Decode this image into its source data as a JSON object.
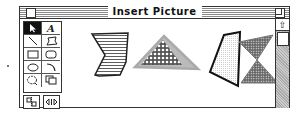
{
  "window": {
    "title": "Insert Picture",
    "close_box": "close-box",
    "zoom_box": "zoom-box"
  },
  "palette": {
    "tools": [
      {
        "name": "arrow-tool",
        "glyph": "↖",
        "selected": true
      },
      {
        "name": "text-tool",
        "glyph": "A",
        "selected": false
      },
      {
        "name": "line-tool",
        "glyph": "╲",
        "selected": false
      },
      {
        "name": "freeform-tool",
        "glyph": "▱",
        "selected": false
      },
      {
        "name": "rectangle-tool",
        "glyph": "▭",
        "selected": false
      },
      {
        "name": "rounded-rectangle-tool",
        "glyph": "▢",
        "selected": false
      },
      {
        "name": "oval-tool",
        "glyph": "⬭",
        "selected": false
      },
      {
        "name": "arc-tool",
        "glyph": "⌒",
        "selected": false
      },
      {
        "name": "lasso-tool",
        "glyph": "◌",
        "selected": false
      },
      {
        "name": "duplicate-tool",
        "glyph": "⧉",
        "selected": false
      }
    ],
    "bottom_buttons": [
      {
        "name": "flip-button",
        "glyph": "⇅"
      },
      {
        "name": "rotate-button",
        "glyph": "⇔"
      }
    ]
  },
  "canvas": {
    "shapes": [
      {
        "name": "striped-chevron-shape",
        "fill": "horizontal-lines"
      },
      {
        "name": "dotted-triangle-shape",
        "fill": "circles-on-gray"
      },
      {
        "name": "outlined-quadrilateral-shape",
        "fill": "fine-dots"
      },
      {
        "name": "hourglass-shape",
        "fill": "dots-on-gray"
      }
    ]
  },
  "scrollbar": {
    "up_arrow": "⇧"
  }
}
